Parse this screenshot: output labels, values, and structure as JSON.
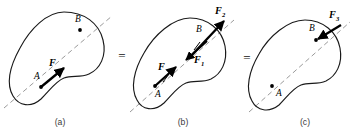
{
  "figure": {
    "colors": {
      "body_outline": "#1a1a1a",
      "line_of_action": "#9a9a9a",
      "vector": "#000000",
      "caption": "#3a3a3a",
      "background": "#ffffff"
    },
    "operators": [
      {
        "symbol": "=",
        "x": 122,
        "y": 60
      },
      {
        "symbol": "=",
        "x": 247,
        "y": 62
      }
    ],
    "panels": [
      {
        "id": "a",
        "caption": "(a)",
        "caption_x": 60,
        "caption_y": 125,
        "points": [
          {
            "label": "A",
            "label_x": 34,
            "label_y": 79,
            "dot_x": 41,
            "dot_y": 87
          },
          {
            "label": "B",
            "label_x": 75,
            "label_y": 22,
            "dot_x": 80,
            "dot_y": 30
          }
        ],
        "vectors": [
          {
            "label": "F",
            "subscript": "",
            "label_x": 49,
            "label_y": 66,
            "tail_x": 41,
            "tail_y": 87,
            "tip_x": 64,
            "tip_y": 68
          }
        ]
      },
      {
        "id": "b",
        "caption": "(b)",
        "caption_x": 183,
        "caption_y": 125,
        "points": [
          {
            "label": "A",
            "label_x": 156,
            "label_y": 96,
            "dot_x": 155,
            "dot_y": 86
          },
          {
            "label": "B",
            "label_x": 197,
            "label_y": 31,
            "dot_x": 0,
            "dot_y": 0
          }
        ],
        "vectors": [
          {
            "label": "F",
            "subscript": "",
            "label_x": 160,
            "label_y": 70,
            "tail_x": 155,
            "tail_y": 86,
            "tip_x": 176,
            "tip_y": 67
          },
          {
            "label": "F",
            "subscript": "1",
            "label_x": 196,
            "label_y": 62,
            "tail_x": 207,
            "tail_y": 41,
            "tip_x": 185,
            "tip_y": 60
          },
          {
            "label": "F",
            "subscript": "2",
            "label_x": 217,
            "label_y": 13,
            "tail_x": 188,
            "tail_y": 58,
            "tip_x": 224,
            "tip_y": 21
          }
        ]
      },
      {
        "id": "c",
        "caption": "(c)",
        "caption_x": 305,
        "caption_y": 125,
        "points": [
          {
            "label": "A",
            "label_x": 277,
            "label_y": 95,
            "dot_x": 272,
            "dot_y": 86
          },
          {
            "label": "B",
            "label_x": 311,
            "label_y": 30,
            "dot_x": 316,
            "dot_y": 40
          }
        ],
        "vectors": [
          {
            "label": "F",
            "subscript": "3",
            "label_x": 332,
            "label_y": 17,
            "tail_x": 341,
            "tail_y": 25,
            "tip_x": 316,
            "tip_y": 40
          }
        ]
      }
    ]
  }
}
